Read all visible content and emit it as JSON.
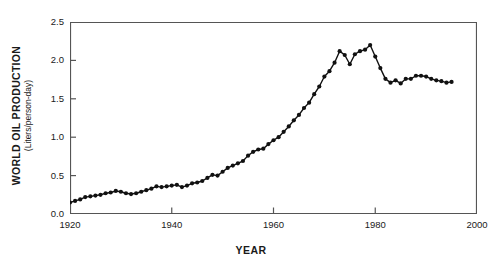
{
  "chart_data": {
    "type": "line",
    "title": "",
    "xlabel": "YEAR",
    "ylabel": "WORLD OIL PRODUCTION",
    "ylabel_units": "(Liters/person-day)",
    "xlim": [
      1920,
      2000
    ],
    "ylim": [
      0.0,
      2.5
    ],
    "xticks": [
      1920,
      1940,
      1960,
      1980,
      2000
    ],
    "xtick_labels": [
      "1920",
      "1940",
      "1960",
      "1980",
      "2000"
    ],
    "yticks": [
      0.0,
      0.5,
      1.0,
      1.5,
      2.0,
      2.5
    ],
    "ytick_labels": [
      "0.0",
      "0.5",
      "1.0",
      "1.5",
      "2.0",
      "2.5"
    ],
    "grid": false,
    "legend": null,
    "marker": "filled-circle",
    "line_color": "#111111",
    "marker_color": "#111111",
    "series": [
      {
        "name": "World oil production per capita",
        "x": [
          1920,
          1921,
          1922,
          1923,
          1924,
          1925,
          1926,
          1927,
          1928,
          1929,
          1930,
          1931,
          1932,
          1933,
          1934,
          1935,
          1936,
          1937,
          1938,
          1939,
          1940,
          1941,
          1942,
          1943,
          1944,
          1945,
          1946,
          1947,
          1948,
          1949,
          1950,
          1951,
          1952,
          1953,
          1954,
          1955,
          1956,
          1957,
          1958,
          1959,
          1960,
          1961,
          1962,
          1963,
          1964,
          1965,
          1966,
          1967,
          1968,
          1969,
          1970,
          1971,
          1972,
          1973,
          1974,
          1975,
          1976,
          1977,
          1978,
          1979,
          1980,
          1981,
          1982,
          1983,
          1984,
          1985,
          1986,
          1987,
          1988,
          1989,
          1990,
          1991,
          1992,
          1993,
          1994,
          1995
        ],
        "y": [
          0.15,
          0.17,
          0.19,
          0.22,
          0.23,
          0.24,
          0.25,
          0.27,
          0.28,
          0.3,
          0.29,
          0.27,
          0.26,
          0.27,
          0.29,
          0.31,
          0.33,
          0.36,
          0.35,
          0.36,
          0.37,
          0.38,
          0.35,
          0.37,
          0.4,
          0.41,
          0.43,
          0.47,
          0.51,
          0.5,
          0.55,
          0.6,
          0.63,
          0.66,
          0.69,
          0.76,
          0.81,
          0.84,
          0.85,
          0.91,
          0.96,
          1.0,
          1.07,
          1.14,
          1.22,
          1.29,
          1.38,
          1.45,
          1.56,
          1.66,
          1.79,
          1.86,
          1.97,
          2.12,
          2.07,
          1.95,
          2.08,
          2.12,
          2.14,
          2.2,
          2.05,
          1.9,
          1.76,
          1.71,
          1.74,
          1.7,
          1.76,
          1.76,
          1.8,
          1.8,
          1.79,
          1.76,
          1.74,
          1.73,
          1.71,
          1.72
        ]
      }
    ]
  },
  "axes": {
    "frame_color": "#555555"
  }
}
